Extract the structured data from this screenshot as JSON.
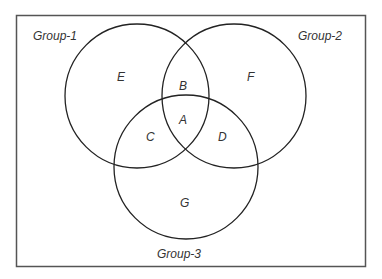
{
  "diagram": {
    "type": "venn",
    "groups": [
      {
        "name": "Group-1",
        "cx": 137,
        "cy": 96,
        "r": 72
      },
      {
        "name": "Group-2",
        "cx": 234,
        "cy": 96,
        "r": 72
      },
      {
        "name": "Group-3",
        "cx": 186,
        "cy": 167,
        "r": 72
      }
    ],
    "regions": [
      {
        "label": "A",
        "x": 183,
        "y": 120
      },
      {
        "label": "B",
        "x": 183,
        "y": 86
      },
      {
        "label": "C",
        "x": 150,
        "y": 137
      },
      {
        "label": "D",
        "x": 222,
        "y": 137
      },
      {
        "label": "E",
        "x": 121,
        "y": 77
      },
      {
        "label": "F",
        "x": 251,
        "y": 77
      },
      {
        "label": "G",
        "x": 184,
        "y": 203
      }
    ],
    "group_labels": [
      {
        "text": "Group-1",
        "x": 33,
        "y": 40
      },
      {
        "text": "Group-2",
        "x": 298,
        "y": 40
      },
      {
        "text": "Group-3",
        "x": 157,
        "y": 258
      }
    ],
    "colors": {
      "stroke": "#222222",
      "frame": "#555555",
      "text": "#333333",
      "background": "#ffffff"
    }
  }
}
